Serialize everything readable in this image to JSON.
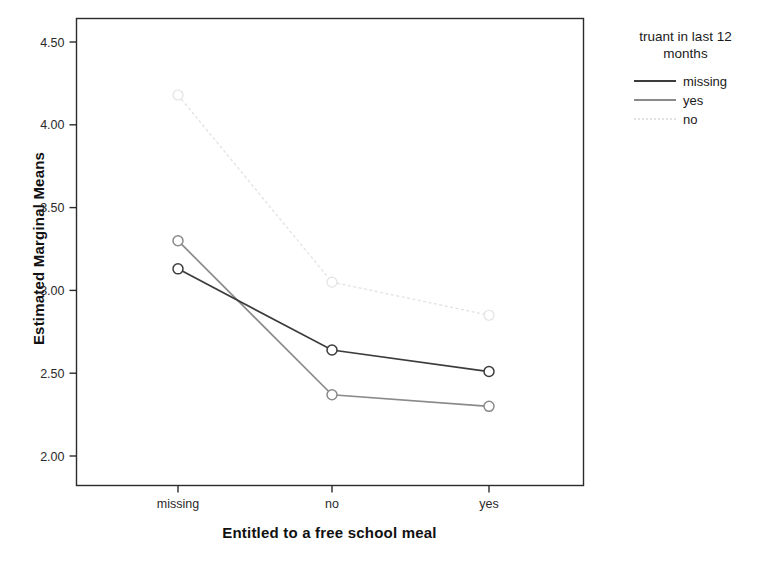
{
  "chart_data": {
    "type": "line",
    "title": "",
    "xlabel": "Entitled to a free school meal",
    "ylabel": "Estimated Marginal Means",
    "categories": [
      "missing",
      "no",
      "yes"
    ],
    "ylim": [
      2.0,
      4.5
    ],
    "yticks": [
      "2.00",
      "2.50",
      "3.00",
      "3.50",
      "4.00",
      "4.50"
    ],
    "ytick_values": [
      2.0,
      2.5,
      3.0,
      3.5,
      4.0,
      4.5
    ],
    "grid": false,
    "legend_position": "right",
    "legend_title": "truant in last 12 months",
    "series": [
      {
        "name": "missing",
        "values": [
          3.13,
          2.64,
          2.51
        ],
        "color": "#3c3c3c",
        "style": "solid"
      },
      {
        "name": "yes",
        "values": [
          3.3,
          2.37,
          2.3
        ],
        "color": "#8a8a8a",
        "style": "solid"
      },
      {
        "name": "no",
        "values": [
          4.18,
          3.05,
          2.85
        ],
        "color": "#e2e2e2",
        "style": "dotted"
      }
    ]
  },
  "axes": {
    "y_title": "Estimated Marginal Means",
    "x_title": "Entitled to a free school meal",
    "y_tick_labels": [
      "4.50",
      "4.00",
      "3.50",
      "3.00",
      "2.50",
      "2.00"
    ],
    "x_tick_labels": [
      "missing",
      "no",
      "yes"
    ]
  },
  "legend": {
    "title_line1": "truant in last 12",
    "title_line2": "months",
    "items": [
      {
        "label": "missing",
        "color": "#3c3c3c",
        "style": "solid"
      },
      {
        "label": "yes",
        "color": "#8a8a8a",
        "style": "solid"
      },
      {
        "label": "no",
        "color": "#e2e2e2",
        "style": "dotted"
      }
    ]
  }
}
